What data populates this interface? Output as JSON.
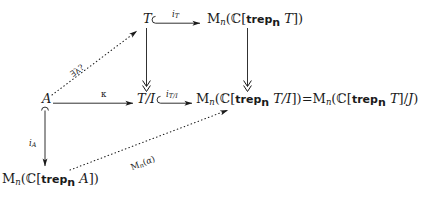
{
  "diagram": {
    "type": "commutative-diagram",
    "nodes": [
      {
        "id": "T",
        "label": "T",
        "x": 143,
        "y": 18
      },
      {
        "id": "MnT",
        "label": "M_n(C[trep_n T])",
        "x": 207,
        "y": 18
      },
      {
        "id": "A",
        "label": "A",
        "x": 42,
        "y": 98
      },
      {
        "id": "TI",
        "label": "T/I",
        "x": 139,
        "y": 98
      },
      {
        "id": "MnTI",
        "label": "M_n(C[trep_n T/I])=M_n(C[trep_n T]/J)",
        "x": 196,
        "y": 98
      },
      {
        "id": "MnA",
        "label": "M_n(C[trep_n A])",
        "x": 2,
        "y": 178
      }
    ],
    "arrows": [
      {
        "id": "i_T",
        "label": "i_T",
        "from": "T",
        "to": "MnT",
        "style": "hooked-inclusion",
        "direction": "right"
      },
      {
        "id": "i_T_I",
        "label": "i_T/I",
        "from": "TI",
        "to": "MnTI",
        "style": "hooked-inclusion",
        "direction": "right"
      },
      {
        "id": "kappa",
        "label": "κ",
        "from": "A",
        "to": "TI",
        "style": "solid",
        "direction": "right"
      },
      {
        "id": "surj_T",
        "label": "",
        "from": "T",
        "to": "TI",
        "style": "double-head",
        "direction": "down"
      },
      {
        "id": "surj_M",
        "label": "",
        "from": "MnT",
        "to": "MnTI",
        "style": "double-head",
        "direction": "down"
      },
      {
        "id": "i_A",
        "label": "i_A",
        "from": "A",
        "to": "MnA",
        "style": "hooked-inclusion",
        "direction": "down"
      },
      {
        "id": "lambda",
        "label": "∃λ?",
        "from": "A",
        "to": "T",
        "style": "dotted",
        "direction": "up-right"
      },
      {
        "id": "Mn_a",
        "label": "M_n(α)",
        "from": "MnA",
        "to": "MnTI",
        "style": "dotted",
        "direction": "up-right"
      }
    ],
    "labels": {
      "i_T": {
        "base": "i",
        "sub": "T"
      },
      "i_T_I": {
        "base": "i",
        "sub": "T/I"
      },
      "i_A": {
        "base": "i",
        "sub": "A"
      },
      "kappa": "κ",
      "exists_lambda": "∃λ?",
      "Mn_alpha_base": "M",
      "Mn_alpha_sub": "n",
      "Mn_alpha_arg": "(α)"
    },
    "glyphs": {
      "matrix": "M",
      "matrix_sub": "n",
      "complex": "ℂ",
      "trep": "trep",
      "trep_sub": "n",
      "hook_inclusion": "⊂",
      "algebra_T": "T",
      "algebra_A": "A",
      "quotient_TI": "T/I",
      "quotient_J": "/J",
      "equals": "="
    },
    "colors": {
      "ink": "#1a1a1a",
      "background": "#ffffff"
    }
  }
}
